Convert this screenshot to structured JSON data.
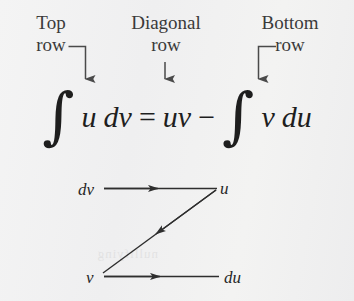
{
  "figure": {
    "name": "integration-by-parts-lipet-z-diagram",
    "background_color": "#f1f1f1",
    "ink_color": "#2c2c2c",
    "bleed_through_text": "nullifying"
  },
  "column_labels": [
    {
      "id": "top",
      "line1": "Top",
      "line2": "row"
    },
    {
      "id": "diagonal",
      "line1": "Diagonal",
      "line2": "row"
    },
    {
      "id": "bottom",
      "line1": "Bottom",
      "line2": "row"
    }
  ],
  "equation": {
    "full_text": "∫ u dv = uv − ∫ v du",
    "integral_sign": "∫",
    "term_u": "u",
    "term_dv": "dv",
    "equals": "=",
    "term_uv": "uv",
    "minus": "−",
    "term_v": "v",
    "term_du": "du"
  },
  "diagram": {
    "nodes": [
      {
        "id": "dv",
        "label": "dv",
        "position": "top-left"
      },
      {
        "id": "u",
        "label": "u",
        "position": "top-right"
      },
      {
        "id": "v",
        "label": "v",
        "position": "bottom-left"
      },
      {
        "id": "du",
        "label": "du",
        "position": "bottom-right"
      }
    ],
    "edges": [
      {
        "id": "top-row",
        "from": "dv",
        "to": "u",
        "direction": "right"
      },
      {
        "id": "diagonal-row",
        "from": "u",
        "to": "v",
        "direction": "down-left"
      },
      {
        "id": "bottom-row",
        "from": "v",
        "to": "du",
        "direction": "right"
      }
    ]
  },
  "pointer_arrows": [
    {
      "id": "top-row-pointer",
      "shape": "elbow-right-then-down",
      "targets": "top-row"
    },
    {
      "id": "diagonal-row-pointer",
      "shape": "straight-down",
      "targets": "diagonal-row"
    },
    {
      "id": "bottom-row-pointer",
      "shape": "elbow-left-then-down",
      "targets": "bottom-row"
    }
  ]
}
